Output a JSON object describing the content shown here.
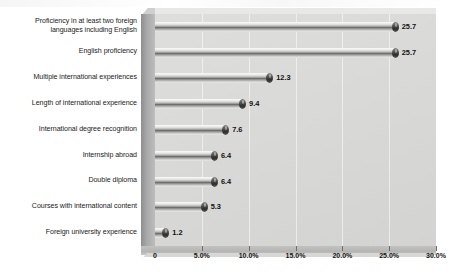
{
  "chart_data": {
    "type": "bar",
    "orientation": "horizontal",
    "title": "",
    "xlabel": "",
    "ylabel": "",
    "categories": [
      "Proficiency in at least two foreign languages including English",
      "English proficiency",
      "Multiple international experiences",
      "Length of international experience",
      "International degree recognition",
      "Internship abroad",
      "Double diploma",
      "Courses with international content",
      "Foreign university experience"
    ],
    "values": [
      25.7,
      25.7,
      12.3,
      9.4,
      7.6,
      6.4,
      6.4,
      5.3,
      1.2
    ],
    "value_labels": [
      "25.7",
      "25.7",
      "12.3",
      "9.4",
      "7.6",
      "6.4",
      "6.4",
      "5.3",
      "1.2"
    ],
    "xlim": [
      0,
      30
    ],
    "xticks": [
      0,
      5,
      10,
      15,
      20,
      25,
      30
    ],
    "xtick_labels": [
      "0",
      "5.0%",
      "10.0%",
      "15.0%",
      "20.0%",
      "25.0%",
      "30.0%"
    ],
    "grid": true,
    "legend": "none",
    "style": "3d-cylinder-grayscale"
  },
  "colors": {
    "plot_background": "#d9d9d7",
    "plot_wall": "#a8a8a8",
    "bar_highlight": "#f2f2f0",
    "bar_shadow": "#6f6f6d",
    "bar_cap": "#2c2c2a",
    "text": "#1b1b1b",
    "gridline": "#ffffff",
    "page_background": "#ffffff"
  },
  "category_label_lines": [
    [
      "Proficiency in at least two foreign",
      "languages including English"
    ],
    [
      "English proficiency"
    ],
    [
      "Multiple international experiences"
    ],
    [
      "Length of international experience"
    ],
    [
      "International degree recognition"
    ],
    [
      "Internship abroad"
    ],
    [
      "Double diploma"
    ],
    [
      "Courses with international content"
    ],
    [
      "Foreign university experience"
    ]
  ]
}
